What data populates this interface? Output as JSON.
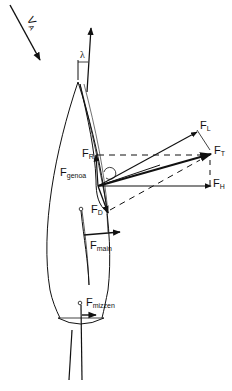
{
  "diagram": {
    "type": "sail force diagram (top view of yacht)",
    "colors": {
      "ink": "#111111",
      "background": "#ffffff"
    },
    "labels": {
      "va": "V",
      "va_sub": "A",
      "lambda": "λ",
      "fl": "F",
      "fl_sub": "L",
      "ft": "F",
      "ft_sub": "T",
      "fh": "F",
      "fh_sub": "H",
      "fr": "F",
      "fr_sub": "R",
      "fd": "F",
      "fd_sub": "D",
      "fgenoa": "F",
      "fgenoa_sub": "genoa",
      "fmain": "F",
      "fmain_sub": "main",
      "fmizzen": "F",
      "fmizzen_sub": "mizzen"
    }
  }
}
